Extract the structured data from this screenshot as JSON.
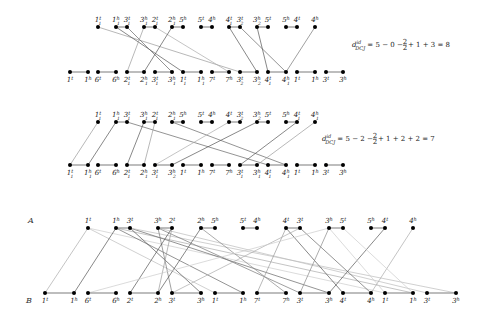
{
  "diagrams": [
    {
      "id": "d1",
      "top_y": 27,
      "bottom_y": 72,
      "top_nodes": [
        {
          "x": 98,
          "g": "1",
          "e": "t",
          "s": "1"
        },
        {
          "x": 116,
          "g": "1",
          "e": "h",
          "s": "1"
        },
        {
          "x": 127,
          "g": "3",
          "e": "t",
          "s": "1"
        },
        {
          "x": 144,
          "g": "3",
          "e": "h",
          "s": "1"
        },
        {
          "x": 155,
          "g": "2",
          "e": "t",
          "s": "1"
        },
        {
          "x": 172,
          "g": "2",
          "e": "h",
          "s": "1"
        },
        {
          "x": 183,
          "g": "5",
          "e": "h",
          "s": ""
        },
        {
          "x": 201,
          "g": "5",
          "e": "t",
          "s": ""
        },
        {
          "x": 212,
          "g": "4",
          "e": "h",
          "s": ""
        },
        {
          "x": 229,
          "g": "4",
          "e": "t",
          "s": "1"
        },
        {
          "x": 240,
          "g": "3",
          "e": "t",
          "s": "2"
        },
        {
          "x": 257,
          "g": "3",
          "e": "h",
          "s": "2"
        },
        {
          "x": 268,
          "g": "5",
          "e": "t",
          "s": ""
        },
        {
          "x": 286,
          "g": "5",
          "e": "h",
          "s": ""
        },
        {
          "x": 297,
          "g": "4",
          "e": "t",
          "s": ""
        },
        {
          "x": 315,
          "g": "4",
          "e": "h",
          "s": ""
        }
      ],
      "bottom_nodes": [
        {
          "x": 70,
          "g": "1",
          "e": "t",
          "s": ""
        },
        {
          "x": 88,
          "g": "1",
          "e": "h",
          "s": ""
        },
        {
          "x": 98,
          "g": "6",
          "e": "t",
          "s": ""
        },
        {
          "x": 116,
          "g": "6",
          "e": "h",
          "s": ""
        },
        {
          "x": 127,
          "g": "2",
          "e": "t",
          "s": "1"
        },
        {
          "x": 144,
          "g": "2",
          "e": "h",
          "s": "1"
        },
        {
          "x": 155,
          "g": "3",
          "e": "t",
          "s": "1"
        },
        {
          "x": 172,
          "g": "3",
          "e": "h",
          "s": "1"
        },
        {
          "x": 183,
          "g": "1",
          "e": "t",
          "s": "1"
        },
        {
          "x": 201,
          "g": "1",
          "e": "h",
          "s": "1"
        },
        {
          "x": 212,
          "g": "7",
          "e": "t",
          "s": ""
        },
        {
          "x": 229,
          "g": "7",
          "e": "h",
          "s": ""
        },
        {
          "x": 240,
          "g": "3",
          "e": "t",
          "s": "2"
        },
        {
          "x": 257,
          "g": "3",
          "e": "h",
          "s": "2"
        },
        {
          "x": 268,
          "g": "4",
          "e": "t",
          "s": "1"
        },
        {
          "x": 286,
          "g": "4",
          "e": "h",
          "s": "1"
        },
        {
          "x": 297,
          "g": "1",
          "e": "t",
          "s": ""
        },
        {
          "x": 315,
          "g": "1",
          "e": "h",
          "s": ""
        },
        {
          "x": 326,
          "g": "3",
          "e": "t",
          "s": ""
        },
        {
          "x": 343,
          "g": "3",
          "e": "h",
          "s": ""
        }
      ],
      "top_adj": [
        [
          1,
          2
        ],
        [
          3,
          4
        ],
        [
          5,
          6
        ],
        [
          7,
          8
        ],
        [
          9,
          10
        ],
        [
          11,
          12
        ],
        [
          13,
          14
        ]
      ],
      "bottom_adj": [
        [
          0,
          1
        ],
        [
          2,
          3
        ],
        [
          4,
          5
        ],
        [
          6,
          7
        ],
        [
          8,
          9
        ],
        [
          10,
          11
        ],
        [
          12,
          13
        ],
        [
          14,
          15
        ],
        [
          16,
          17
        ],
        [
          18,
          19
        ]
      ],
      "edges": [
        {
          "t": 0,
          "b": 12,
          "c": "#999"
        },
        {
          "t": 1,
          "b": 8,
          "c": "#555"
        },
        {
          "t": 2,
          "b": 7,
          "c": "#666"
        },
        {
          "t": 3,
          "b": 4,
          "c": "#999"
        },
        {
          "t": 4,
          "b": 11,
          "c": "#aaa"
        },
        {
          "t": 5,
          "b": 5,
          "c": "#555"
        },
        {
          "t": 9,
          "b": 13,
          "c": "#555"
        },
        {
          "t": 10,
          "b": 15,
          "c": "#666"
        },
        {
          "t": 11,
          "b": 14,
          "c": "#555"
        },
        {
          "t": 15,
          "b": 15,
          "c": "#777"
        }
      ],
      "formula": {
        "x": 352,
        "y": 47,
        "lhs": "d",
        "lhs_sup": "id",
        "lhs_sub": "DCJ",
        "rhs": " = 5 − 0 − ",
        "frac_num": "2",
        "frac_den": "2",
        "tail": " + 1 + 3 = 8"
      }
    },
    {
      "id": "d2",
      "top_y": 122,
      "bottom_y": 165,
      "top_nodes": [
        {
          "x": 98,
          "g": "1",
          "e": "t",
          "s": "1"
        },
        {
          "x": 116,
          "g": "1",
          "e": "h",
          "s": "1"
        },
        {
          "x": 127,
          "g": "3",
          "e": "t",
          "s": "1"
        },
        {
          "x": 144,
          "g": "3",
          "e": "h",
          "s": "1"
        },
        {
          "x": 155,
          "g": "2",
          "e": "t",
          "s": "1"
        },
        {
          "x": 172,
          "g": "2",
          "e": "h",
          "s": "1"
        },
        {
          "x": 183,
          "g": "5",
          "e": "h",
          "s": ""
        },
        {
          "x": 201,
          "g": "5",
          "e": "t",
          "s": ""
        },
        {
          "x": 212,
          "g": "4",
          "e": "h",
          "s": ""
        },
        {
          "x": 229,
          "g": "4",
          "e": "t",
          "s": ""
        },
        {
          "x": 240,
          "g": "3",
          "e": "t",
          "s": "2"
        },
        {
          "x": 257,
          "g": "3",
          "e": "h",
          "s": "2"
        },
        {
          "x": 268,
          "g": "5",
          "e": "t",
          "s": ""
        },
        {
          "x": 286,
          "g": "5",
          "e": "h",
          "s": ""
        },
        {
          "x": 297,
          "g": "4",
          "e": "t",
          "s": "1"
        },
        {
          "x": 315,
          "g": "4",
          "e": "h",
          "s": "1"
        }
      ],
      "bottom_nodes": [
        {
          "x": 70,
          "g": "1",
          "e": "t",
          "s": "1"
        },
        {
          "x": 88,
          "g": "1",
          "e": "h",
          "s": "1"
        },
        {
          "x": 98,
          "g": "6",
          "e": "t",
          "s": ""
        },
        {
          "x": 116,
          "g": "6",
          "e": "h",
          "s": ""
        },
        {
          "x": 127,
          "g": "2",
          "e": "t",
          "s": "1"
        },
        {
          "x": 144,
          "g": "2",
          "e": "h",
          "s": "1"
        },
        {
          "x": 155,
          "g": "3",
          "e": "t",
          "s": "1"
        },
        {
          "x": 172,
          "g": "3",
          "e": "h",
          "s": "2"
        },
        {
          "x": 183,
          "g": "1",
          "e": "t",
          "s": ""
        },
        {
          "x": 201,
          "g": "1",
          "e": "h",
          "s": ""
        },
        {
          "x": 212,
          "g": "7",
          "e": "t",
          "s": ""
        },
        {
          "x": 229,
          "g": "7",
          "e": "h",
          "s": ""
        },
        {
          "x": 240,
          "g": "3",
          "e": "t",
          "s": "1"
        },
        {
          "x": 257,
          "g": "3",
          "e": "h",
          "s": "1"
        },
        {
          "x": 268,
          "g": "4",
          "e": "t",
          "s": "1"
        },
        {
          "x": 286,
          "g": "4",
          "e": "h",
          "s": "1"
        },
        {
          "x": 297,
          "g": "1",
          "e": "t",
          "s": ""
        },
        {
          "x": 315,
          "g": "1",
          "e": "h",
          "s": ""
        },
        {
          "x": 326,
          "g": "3",
          "e": "t",
          "s": ""
        },
        {
          "x": 343,
          "g": "3",
          "e": "h",
          "s": ""
        }
      ],
      "top_adj": [
        [
          1,
          2
        ],
        [
          3,
          4
        ],
        [
          5,
          6
        ],
        [
          7,
          8
        ],
        [
          9,
          10
        ],
        [
          11,
          12
        ],
        [
          13,
          14
        ]
      ],
      "bottom_adj": [
        [
          0,
          1
        ],
        [
          2,
          3
        ],
        [
          4,
          5
        ],
        [
          6,
          7
        ],
        [
          8,
          9
        ],
        [
          10,
          11
        ],
        [
          12,
          13
        ],
        [
          14,
          15
        ],
        [
          16,
          17
        ],
        [
          18,
          19
        ]
      ],
      "edges": [
        {
          "t": 0,
          "b": 0,
          "c": "#999"
        },
        {
          "t": 1,
          "b": 1,
          "c": "#555"
        },
        {
          "t": 2,
          "b": 14,
          "c": "#666"
        },
        {
          "t": 3,
          "b": 4,
          "c": "#555"
        },
        {
          "t": 4,
          "b": 5,
          "c": "#999"
        },
        {
          "t": 5,
          "b": 15,
          "c": "#666"
        },
        {
          "t": 9,
          "b": 6,
          "c": "#aaa"
        },
        {
          "t": 11,
          "b": 7,
          "c": "#555"
        },
        {
          "t": 14,
          "b": 12,
          "c": "#555"
        },
        {
          "t": 15,
          "b": 13,
          "c": "#999"
        }
      ],
      "formula": {
        "x": 322,
        "y": 141,
        "lhs": "d",
        "lhs_sup": "id",
        "lhs_sub": "DCJ",
        "rhs": " = 5 − 2 − ",
        "frac_num": "2",
        "frac_den": "2",
        "tail": " + 1 + 2 + 2 = 7"
      }
    }
  ],
  "adjacency_graph": {
    "label_a": "A",
    "label_b": "B",
    "top_y": 228,
    "bottom_y": 293,
    "top_nodes": [
      {
        "x": 88,
        "g": "1",
        "e": "t"
      },
      {
        "x": 116,
        "g": "1",
        "e": "h"
      },
      {
        "x": 130,
        "g": "3",
        "e": "t"
      },
      {
        "x": 158,
        "g": "3",
        "e": "h"
      },
      {
        "x": 172,
        "g": "2",
        "e": "t"
      },
      {
        "x": 201,
        "g": "2",
        "e": "h"
      },
      {
        "x": 215,
        "g": "5",
        "e": "h"
      },
      {
        "x": 243,
        "g": "5",
        "e": "t"
      },
      {
        "x": 257,
        "g": "4",
        "e": "h"
      },
      {
        "x": 286,
        "g": "4",
        "e": "t"
      },
      {
        "x": 300,
        "g": "3",
        "e": "t"
      },
      {
        "x": 329,
        "g": "3",
        "e": "h"
      },
      {
        "x": 343,
        "g": "5",
        "e": "t"
      },
      {
        "x": 371,
        "g": "5",
        "e": "h"
      },
      {
        "x": 385,
        "g": "4",
        "e": "t"
      },
      {
        "x": 413,
        "g": "4",
        "e": "h"
      }
    ],
    "bottom_nodes": [
      {
        "x": 45,
        "g": "1",
        "e": "t"
      },
      {
        "x": 74,
        "g": "1",
        "e": "h"
      },
      {
        "x": 88,
        "g": "6",
        "e": "t"
      },
      {
        "x": 116,
        "g": "6",
        "e": "h"
      },
      {
        "x": 130,
        "g": "2",
        "e": "t"
      },
      {
        "x": 158,
        "g": "2",
        "e": "h"
      },
      {
        "x": 172,
        "g": "3",
        "e": "t"
      },
      {
        "x": 201,
        "g": "3",
        "e": "h"
      },
      {
        "x": 215,
        "g": "1",
        "e": "t"
      },
      {
        "x": 243,
        "g": "1",
        "e": "h"
      },
      {
        "x": 257,
        "g": "7",
        "e": "t"
      },
      {
        "x": 286,
        "g": "7",
        "e": "h"
      },
      {
        "x": 300,
        "g": "3",
        "e": "t"
      },
      {
        "x": 329,
        "g": "3",
        "e": "h"
      },
      {
        "x": 343,
        "g": "4",
        "e": "t"
      },
      {
        "x": 371,
        "g": "4",
        "e": "h"
      },
      {
        "x": 385,
        "g": "1",
        "e": "t"
      },
      {
        "x": 413,
        "g": "1",
        "e": "h"
      },
      {
        "x": 427,
        "g": "3",
        "e": "t"
      },
      {
        "x": 456,
        "g": "3",
        "e": "h"
      }
    ],
    "top_adj": [
      [
        1,
        2
      ],
      [
        3,
        4
      ],
      [
        5,
        6
      ],
      [
        7,
        8
      ],
      [
        9,
        10
      ],
      [
        11,
        12
      ],
      [
        13,
        14
      ]
    ],
    "bottom_adj": [
      [
        0,
        1
      ],
      [
        2,
        3
      ],
      [
        4,
        5
      ],
      [
        6,
        7
      ],
      [
        8,
        9
      ],
      [
        10,
        11
      ],
      [
        12,
        13
      ],
      [
        14,
        15
      ],
      [
        16,
        17
      ],
      [
        18,
        19
      ]
    ],
    "edges": [
      {
        "t": 0,
        "b": 0,
        "c": "#aaa"
      },
      {
        "t": 0,
        "b": 8,
        "c": "#bbb"
      },
      {
        "t": 0,
        "b": 16,
        "c": "#ccc"
      },
      {
        "t": 1,
        "b": 1,
        "c": "#555"
      },
      {
        "t": 1,
        "b": 9,
        "c": "#666"
      },
      {
        "t": 1,
        "b": 17,
        "c": "#aaa"
      },
      {
        "t": 2,
        "b": 7,
        "c": "#555"
      },
      {
        "t": 2,
        "b": 13,
        "c": "#666"
      },
      {
        "t": 2,
        "b": 19,
        "c": "#bbb"
      },
      {
        "t": 3,
        "b": 6,
        "c": "#777"
      },
      {
        "t": 3,
        "b": 12,
        "c": "#777"
      },
      {
        "t": 3,
        "b": 18,
        "c": "#bbb"
      },
      {
        "t": 4,
        "b": 4,
        "c": "#555"
      },
      {
        "t": 4,
        "b": 5,
        "c": "#999"
      },
      {
        "t": 5,
        "b": 5,
        "c": "#555"
      },
      {
        "t": 5,
        "b": 11,
        "c": "#888"
      },
      {
        "t": 9,
        "b": 14,
        "c": "#555"
      },
      {
        "t": 9,
        "b": 10,
        "c": "#999"
      },
      {
        "t": 10,
        "b": 15,
        "c": "#666"
      },
      {
        "t": 10,
        "b": 6,
        "c": "#aaa"
      },
      {
        "t": 11,
        "b": 12,
        "c": "#888"
      },
      {
        "t": 11,
        "b": 2,
        "c": "#ccc"
      },
      {
        "t": 14,
        "b": 13,
        "c": "#555"
      },
      {
        "t": 15,
        "b": 15,
        "c": "#aaa"
      },
      {
        "t": 11,
        "b": 16,
        "c": "#ccc"
      },
      {
        "t": 12,
        "b": 17,
        "c": "#ccc"
      }
    ]
  }
}
